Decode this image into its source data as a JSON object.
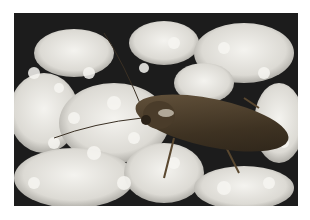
{
  "image": {
    "subject": "Cockroach on white flower cluster",
    "description": "Close-up photograph of a brown cockroach with long antennae resting on a dense cluster of small white flowers against a dark background.",
    "colors": {
      "background": "#1c1c1c",
      "flowers": "#ecebe6",
      "flowers_shadow": "#bdbcb5",
      "insect_body": "#4a3c2a",
      "insect_highlight": "#c9c2b4",
      "border": "#ffffff"
    }
  }
}
